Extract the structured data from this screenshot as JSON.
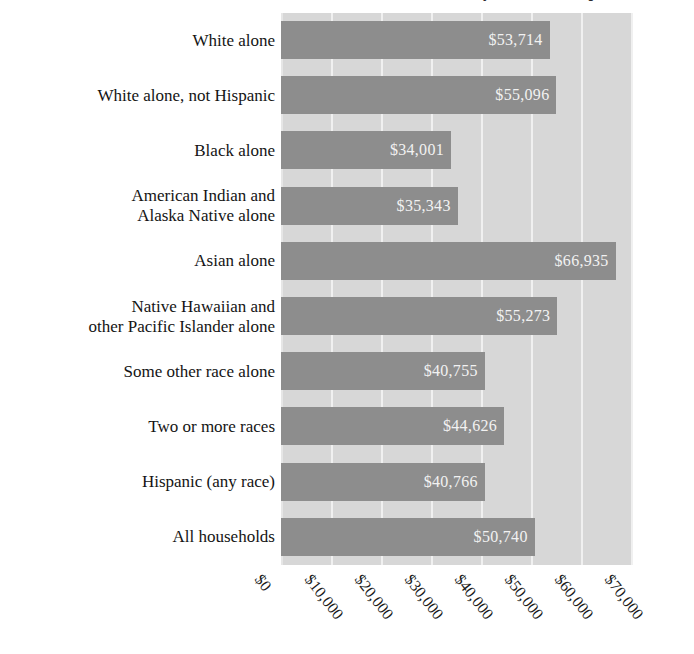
{
  "chart_data": {
    "type": "bar",
    "orientation": "horizontal",
    "title": "Median Household Income by Race and Hispanic Origin",
    "xlabel": "",
    "ylabel": "",
    "xlim": [
      0,
      70400
    ],
    "grid": true,
    "legend": null,
    "xticks": [
      "$0",
      "$10,000",
      "$20,000",
      "$30,000",
      "$40,000",
      "$50,000",
      "$60,000",
      "$70,000"
    ],
    "xtick_values": [
      0,
      10000,
      20000,
      30000,
      40000,
      50000,
      60000,
      70000
    ],
    "categories": [
      "White alone",
      "White alone, not Hispanic",
      "Black alone",
      "American Indian and\nAlaska Native alone",
      "Asian alone",
      "Native Hawaiian and\nother Pacific Islander alone",
      "Some other race alone",
      "Two or more races",
      "Hispanic (any race)",
      "All households"
    ],
    "values": [
      53714,
      55096,
      34001,
      35343,
      66935,
      55273,
      40755,
      44626,
      40766,
      50740
    ],
    "value_labels": [
      "$53,714",
      "$55,096",
      "$34,001",
      "$35,343",
      "$66,935",
      "$55,273",
      "$40,755",
      "$44,626",
      "$40,766",
      "$50,740"
    ],
    "colors": {
      "bar": "#8d8d8d",
      "plot_background": "#d7d7d7",
      "gridline": "#f0f0f0",
      "value_label": "#f2f2f2",
      "category_label": "#141414"
    }
  }
}
